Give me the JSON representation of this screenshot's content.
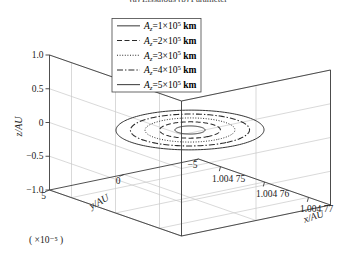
{
  "figure": {
    "top_caption": "(a)  Lissajous  (b)  Parameter",
    "background_color": "#ffffff",
    "line_color": "#2b2b2b",
    "grid_color": "#c9c9c9",
    "axis_color": "#3c3c3c"
  },
  "axes": {
    "x": {
      "label": "x/AU",
      "ticks": [
        "1.004 75",
        "1.004 76",
        "1.004 77"
      ],
      "values": [
        1.00475,
        1.00476,
        1.00477
      ]
    },
    "y": {
      "label": "y/AU",
      "multiplier": "( ×10⁻⁵ )",
      "ticks": [
        "5",
        "0",
        "−5"
      ],
      "values": [
        5,
        0,
        -5
      ]
    },
    "z": {
      "label": "z/AU",
      "ticks": [
        "1.0",
        "0.5",
        "0",
        "−0.5",
        "−1.0"
      ],
      "values": [
        1.0,
        0.5,
        0,
        -0.5,
        -1.0
      ]
    }
  },
  "legend": {
    "entries": [
      {
        "label": "A_z=1×10⁵ km",
        "prefix": "A",
        "sub": "z",
        "eq": "=1×10",
        "exp": "5",
        "unit": " km",
        "style": "solid"
      },
      {
        "label": "A_z=2×10⁵ km",
        "prefix": "A",
        "sub": "z",
        "eq": "=2×10",
        "exp": "5",
        "unit": " km",
        "style": "dashed"
      },
      {
        "label": "A_z=3×10⁵ km",
        "prefix": "A",
        "sub": "z",
        "eq": "=3×10",
        "exp": "5",
        "unit": " km",
        "style": "dotted"
      },
      {
        "label": "A_z=4×10⁵ km",
        "prefix": "A",
        "sub": "z",
        "eq": "=4×10",
        "exp": "5",
        "unit": " km",
        "style": "dashdot"
      },
      {
        "label": "A_z=5×10⁵ km",
        "prefix": "A",
        "sub": "z",
        "eq": "=5×10",
        "exp": "5",
        "unit": " km",
        "style": "solid"
      }
    ]
  },
  "chart_data": {
    "type": "line",
    "title": "",
    "xlabel": "x/AU",
    "ylabel": "y/AU",
    "zlabel": "z/AU",
    "projection": "3d",
    "xlim": [
      1.004745,
      1.004775
    ],
    "ylim": [
      -5,
      5
    ],
    "zlim": [
      -1.0,
      1.0
    ],
    "y_multiplier": 1e-05,
    "grid": true,
    "legend_position": "upper-center",
    "series": [
      {
        "name": "A_z=1×10⁵ km",
        "style": "solid",
        "rx": 2.1e-06,
        "ry": 0.8,
        "cx": 1.00476,
        "cy": 0.0,
        "cz": 0.0
      },
      {
        "name": "A_z=2×10⁵ km",
        "style": "dashed",
        "rx": 4.2e-06,
        "ry": 1.62,
        "cx": 1.00476,
        "cy": 0.0,
        "cz": 0.0
      },
      {
        "name": "A_z=3×10⁵ km",
        "style": "dotted",
        "rx": 6.2e-06,
        "ry": 2.4,
        "cx": 1.00476,
        "cy": 0.0,
        "cz": 0.0
      },
      {
        "name": "A_z=4×10⁵ km",
        "style": "dashdot",
        "rx": 8.2e-06,
        "ry": 3.18,
        "cx": 1.00476,
        "cy": 0.0,
        "cz": 0.0
      },
      {
        "name": "A_z=5×10⁵ km",
        "style": "solid",
        "rx": 1.02e-05,
        "ry": 3.95,
        "cx": 1.00476,
        "cy": 0.0,
        "cz": 0.0
      }
    ]
  }
}
